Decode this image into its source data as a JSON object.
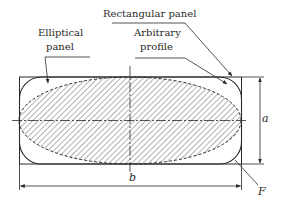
{
  "diagram": {
    "labels": {
      "rectangular_panel": "Rectangular panel",
      "elliptical_panel_line1": "Elliptical",
      "elliptical_panel_line2": "panel",
      "arbitrary_profile_line1": "Arbitrary",
      "arbitrary_profile_line2": "profile",
      "dim_a": "a",
      "dim_b": "b",
      "point_f": "F"
    },
    "colors": {
      "stroke": "#2a2a2a",
      "hatch": "#555555",
      "background": "#ffffff"
    }
  }
}
